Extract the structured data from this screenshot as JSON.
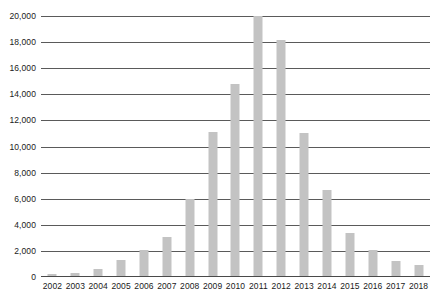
{
  "chart_data": {
    "type": "bar",
    "title": "",
    "subtitle": "",
    "xlabel": "",
    "ylabel": "",
    "categories": [
      "2002",
      "2003",
      "2004",
      "2005",
      "2006",
      "2007",
      "2008",
      "2009",
      "2010",
      "2011",
      "2012",
      "2013",
      "2014",
      "2015",
      "2016",
      "2017",
      "2018"
    ],
    "values": [
      200,
      300,
      600,
      1300,
      2100,
      3100,
      6000,
      11100,
      14800,
      20000,
      18200,
      11000,
      6700,
      3400,
      2100,
      1200,
      900
    ],
    "ylim": [
      0,
      20000
    ],
    "ytick_values": [
      0,
      2000,
      4000,
      6000,
      8000,
      10000,
      12000,
      14000,
      16000,
      18000,
      20000
    ],
    "ytick_labels": [
      "0",
      "2,000",
      "4,000",
      "6,000",
      "8,000",
      "10,000",
      "12,000",
      "14,000",
      "16,000",
      "18,000",
      "20,000"
    ],
    "grid": true,
    "legend": false,
    "legend_position": "none",
    "bar_color": "#c3c3c3",
    "gridline_color": "#5a5a5a",
    "axis_color": "#4a4a4a",
    "text_color": "#1a1a1a"
  }
}
